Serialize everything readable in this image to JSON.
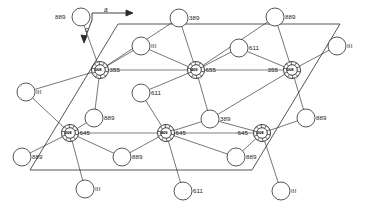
{
  "figure": {
    "type": "crystal-structure-diagram",
    "title": "",
    "background_color": "#ffffff",
    "line_color": "#2b2b2b",
    "text_color": "#1a1a1a",
    "width": 367,
    "height": 211
  },
  "axes": [
    {
      "name": "a-axis",
      "label": "a",
      "direction": "right",
      "x": 104,
      "y": 9
    },
    {
      "name": "c-axis",
      "label": "c",
      "direction": "down-left",
      "x": 85,
      "y": 28
    }
  ],
  "central_atoms": [
    {
      "id": "atom-1",
      "code": "008",
      "bond_label": "355",
      "cx": 100,
      "cy": 70,
      "r": 8.5
    },
    {
      "id": "atom-2",
      "code": "409",
      "bond_label": "655",
      "cx": 196,
      "cy": 70,
      "r": 8.5
    },
    {
      "id": "atom-3",
      "code": "008",
      "bond_label": "355",
      "cx": 292,
      "cy": 70,
      "r": 8.5
    },
    {
      "id": "atom-4",
      "code": "008",
      "bond_label": "645",
      "cx": 70,
      "cy": 133,
      "r": 8.5
    },
    {
      "id": "atom-5",
      "code": "409",
      "bond_label": "645",
      "cx": 166,
      "cy": 133,
      "r": 8.5
    },
    {
      "id": "atom-6",
      "code": "008",
      "bond_label": "645",
      "cx": 262,
      "cy": 133,
      "r": 8.5
    }
  ],
  "ligand_atoms": [
    {
      "id": "lig-1",
      "label": "889",
      "label_side": "left",
      "cx": 81,
      "cy": 17,
      "r": 9
    },
    {
      "id": "lig-2",
      "label": "389",
      "label_side": "right",
      "cx": 179,
      "cy": 18,
      "r": 9
    },
    {
      "id": "lig-3",
      "label": "889",
      "label_side": "right",
      "cx": 275,
      "cy": 17,
      "r": 9
    },
    {
      "id": "lig-4",
      "label": "III",
      "label_side": "right",
      "cx": 141,
      "cy": 46,
      "r": 9
    },
    {
      "id": "lig-5",
      "label": "III",
      "label_side": "right",
      "cx": 337,
      "cy": 46,
      "r": 9
    },
    {
      "id": "lig-6",
      "label": "611",
      "label_side": "right",
      "cx": 239,
      "cy": 48,
      "r": 9
    },
    {
      "id": "lig-7",
      "label": "III",
      "label_side": "right",
      "cx": 26,
      "cy": 92,
      "r": 9
    },
    {
      "id": "lig-8",
      "label": "611",
      "label_side": "right",
      "cx": 141,
      "cy": 93,
      "r": 9
    },
    {
      "id": "lig-9",
      "label": "889",
      "label_side": "right",
      "cx": 94,
      "cy": 118,
      "r": 9
    },
    {
      "id": "lig-10",
      "label": "389",
      "label_side": "right",
      "cx": 210,
      "cy": 119,
      "r": 9
    },
    {
      "id": "lig-11",
      "label": "889",
      "label_side": "right",
      "cx": 306,
      "cy": 118,
      "r": 9
    },
    {
      "id": "lig-12",
      "label": "889",
      "label_side": "right",
      "cx": 22,
      "cy": 157,
      "r": 9
    },
    {
      "id": "lig-13",
      "label": "889",
      "label_side": "right",
      "cx": 122,
      "cy": 157,
      "r": 9
    },
    {
      "id": "lig-14",
      "label": "889",
      "label_side": "right",
      "cx": 236,
      "cy": 157,
      "r": 9
    },
    {
      "id": "lig-15",
      "label": "III",
      "label_side": "right",
      "cx": 85,
      "cy": 189,
      "r": 9
    },
    {
      "id": "lig-16",
      "label": "611",
      "label_side": "right",
      "cx": 183,
      "cy": 191,
      "r": 9
    },
    {
      "id": "lig-17",
      "label": "III",
      "label_side": "right",
      "cx": 281,
      "cy": 191,
      "r": 9
    }
  ],
  "cell_outline": {
    "name": "unit-cell-parallelogram",
    "points": "118,24 340,24 252,170 30,170"
  },
  "notes": {
    "legend": "",
    "caption": ""
  }
}
